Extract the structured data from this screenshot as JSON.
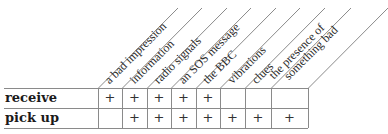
{
  "table": {
    "columns": [
      {
        "label": "a bad impression"
      },
      {
        "label": "information"
      },
      {
        "label": "radio signals"
      },
      {
        "label": "an SOS message"
      },
      {
        "label": "the BBC"
      },
      {
        "label": "vibrations"
      },
      {
        "label": "clues"
      },
      {
        "label": "the presence of",
        "label2": "something bad"
      }
    ],
    "rows": [
      {
        "label": "receive",
        "cells": [
          "+",
          "+",
          "+",
          "+",
          "+",
          "",
          "",
          ""
        ]
      },
      {
        "label": "pick up",
        "cells": [
          "",
          "+",
          "+",
          "+",
          "+",
          "+",
          "+",
          "+"
        ]
      }
    ]
  },
  "colors": {
    "grid_line": "#8a8a8a",
    "text": "#222222"
  }
}
